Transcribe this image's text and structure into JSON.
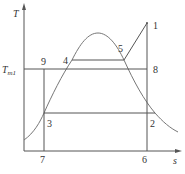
{
  "diagram": {
    "type": "T-s diagram",
    "axes": {
      "y_label": "T",
      "x_label": "s",
      "tm_label_main": "T",
      "tm_label_sub": "m1"
    },
    "points": {
      "p1": "1",
      "p2": "2",
      "p3": "3",
      "p4": "4",
      "p5": "5",
      "p6": "6",
      "p7": "7",
      "p8": "8",
      "p9": "9"
    },
    "colors": {
      "line": "#555555",
      "curve": "#777777",
      "text": "#333333"
    }
  }
}
